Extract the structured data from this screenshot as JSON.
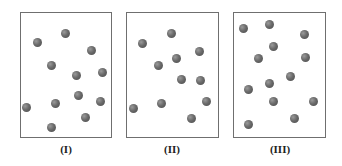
{
  "panels": [
    {
      "label": "(I)",
      "box": {
        "left": 20,
        "top": 12,
        "width": 92,
        "height": 126
      },
      "label_x": 66,
      "particles": [
        [
          37,
          42
        ],
        [
          65,
          33
        ],
        [
          91,
          50
        ],
        [
          51,
          65
        ],
        [
          76,
          75
        ],
        [
          102,
          72
        ],
        [
          78,
          95
        ],
        [
          100,
          101
        ],
        [
          55,
          103
        ],
        [
          26,
          107
        ],
        [
          85,
          117
        ],
        [
          51,
          127
        ]
      ]
    },
    {
      "label": "(II)",
      "box": {
        "left": 126,
        "top": 12,
        "width": 93,
        "height": 126
      },
      "label_x": 172,
      "particles": [
        [
          142,
          43
        ],
        [
          171,
          33
        ],
        [
          199,
          51
        ],
        [
          158,
          65
        ],
        [
          176,
          58
        ],
        [
          181,
          79
        ],
        [
          200,
          80
        ],
        [
          206,
          101
        ],
        [
          161,
          103
        ],
        [
          133,
          108
        ],
        [
          191,
          118
        ]
      ]
    },
    {
      "label": "(III)",
      "box": {
        "left": 233,
        "top": 12,
        "width": 93,
        "height": 126
      },
      "label_x": 280,
      "particles": [
        [
          243,
          28
        ],
        [
          269,
          24
        ],
        [
          304,
          34
        ],
        [
          273,
          46
        ],
        [
          258,
          58
        ],
        [
          305,
          57
        ],
        [
          290,
          76
        ],
        [
          269,
          83
        ],
        [
          248,
          89
        ],
        [
          273,
          101
        ],
        [
          313,
          101
        ],
        [
          294,
          118
        ],
        [
          248,
          124
        ]
      ]
    }
  ],
  "colors": {
    "border": "#6f6f6f",
    "particle": "#5a5a5a",
    "label": "#222222"
  }
}
